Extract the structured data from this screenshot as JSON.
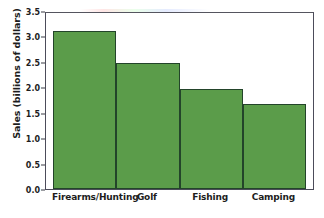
{
  "chart_data": {
    "type": "bar",
    "title": "",
    "subtitle": "",
    "xlabel": "",
    "ylabel": "Sales (billions of dollars)",
    "categories": [
      "Firearms/Hunting",
      "Golf",
      "Fishing",
      "Camping"
    ],
    "values": [
      3.1,
      2.48,
      1.97,
      1.67
    ],
    "series": [
      {
        "name": "Sales",
        "values": [
          3.1,
          2.48,
          1.97,
          1.67
        ]
      }
    ],
    "ylim": [
      0.0,
      3.5
    ],
    "xlim": [
      0,
      4
    ],
    "yticks": [
      "0.0",
      "0.5",
      "1.0",
      "1.5",
      "2.0",
      "2.5",
      "3.0",
      "3.5"
    ],
    "ytick_values": [
      0.0,
      0.5,
      1.0,
      1.5,
      2.0,
      2.5,
      3.0,
      3.5
    ],
    "grid": false,
    "legend": null,
    "legend_position": "none",
    "annotations": [],
    "bar_color": "#5b9c4a",
    "bar_edge_color": "#23442a",
    "axis_color": "#4c4c5a",
    "text_color": "#1d1d1d",
    "background_color": "#ffffff"
  }
}
